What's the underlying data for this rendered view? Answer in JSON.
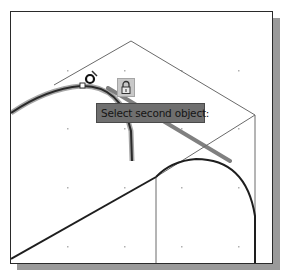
{
  "tooltip": {
    "text": "Select second object:"
  },
  "icons": {
    "cursor": "pickbox-cursor-icon",
    "lock": "lock-icon"
  },
  "colors": {
    "frame_border": "#2a2a2a",
    "shadow": "#9a9a9a",
    "geometry_thin": "#6a6a6a",
    "geometry_thick": "#1e1e1e",
    "highlight": "#555555",
    "tooltip_bg": "#6f6f6f",
    "tooltip_text": "#151515",
    "grid_dot": "#b0b0b0"
  }
}
